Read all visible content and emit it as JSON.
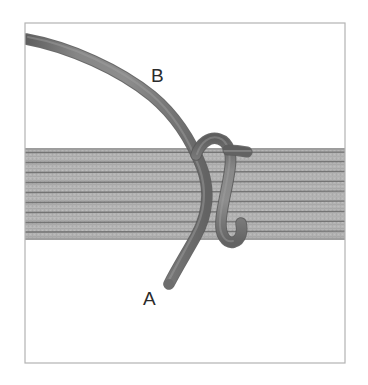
{
  "figure": {
    "background_color": "#ffffff",
    "frame": {
      "name": "image-frame",
      "x": 25,
      "y": 23,
      "width": 320,
      "height": 340,
      "stroke_color": "#b3b3b3",
      "stroke_width": 1.2
    },
    "band": {
      "name": "webbing-band",
      "description": "horizontal striped strap crossing the figure",
      "top": 148,
      "bottom": 240,
      "left": 25,
      "right": 345,
      "fill_color": "#b2b2b2",
      "stripe_color": "#6e6e6e",
      "stripe_count": 9,
      "stripe_y": [
        152,
        162,
        172,
        182,
        192,
        202,
        212,
        222,
        232
      ]
    },
    "rope": {
      "name": "rope-cord",
      "color": "#7a7a7a",
      "highlight_color": "#8f8f8f",
      "shadow_color": "#5f5f5f",
      "width": 10,
      "segments": [
        {
          "name": "rope-upper-tail-to-knot",
          "note": "enters from upper-left edge, sweeps down to the crossing"
        },
        {
          "name": "rope-loop-over-band",
          "note": "loops over the band on the right of the crossing"
        },
        {
          "name": "rope-lower-tail",
          "note": "exits downward below the band to free end A"
        }
      ]
    },
    "labels": [
      {
        "name": "label-b",
        "text": "B",
        "x": 151,
        "y": 82,
        "description": "upper rope end label"
      },
      {
        "name": "label-a",
        "text": "A",
        "x": 143,
        "y": 305,
        "description": "lower rope free end label"
      }
    ]
  }
}
